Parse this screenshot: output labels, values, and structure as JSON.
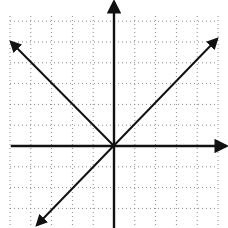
{
  "diagram": {
    "type": "coordinate-plane",
    "colors": {
      "background": "#ffffff",
      "grid": "#888888",
      "lines": "#111111"
    },
    "grid": {
      "x_min": 10,
      "x_max": 218,
      "y_min": 16,
      "y_max": 228,
      "spacing": 20.8,
      "style": "dotted"
    },
    "origin": {
      "x": 114,
      "y": 146
    },
    "axes": {
      "x_axis": {
        "from": [
          11,
          146
        ],
        "to": [
          226,
          146
        ],
        "arrow_end": "right"
      },
      "y_axis": {
        "from": [
          114,
          228
        ],
        "to": [
          114,
          2
        ],
        "arrow_end": "top"
      }
    },
    "lines": [
      {
        "name": "line-y-eq-x",
        "from": [
          37,
          225
        ],
        "to": [
          217,
          39
        ],
        "arrows": [
          "both"
        ]
      },
      {
        "name": "line-y-eq-neg-x",
        "from": [
          114,
          146
        ],
        "to": [
          11,
          42
        ],
        "arrows": [
          "end"
        ]
      }
    ]
  }
}
